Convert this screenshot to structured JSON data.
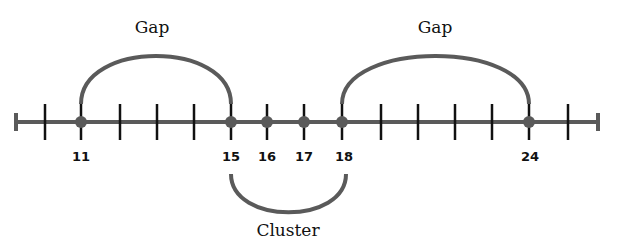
{
  "diagram": {
    "title": "",
    "axis": {
      "y": 122,
      "x_start": 16,
      "x_end": 598,
      "color": "#5a5a5a"
    },
    "ticks_x": [
      45,
      81,
      120,
      157,
      194,
      231,
      267,
      304,
      342,
      381,
      418,
      455,
      492,
      529,
      568
    ],
    "points": [
      {
        "value": "11",
        "x": 81
      },
      {
        "value": "15",
        "x": 231
      },
      {
        "value": "16",
        "x": 267
      },
      {
        "value": "17",
        "x": 304
      },
      {
        "value": "18",
        "x": 342
      },
      {
        "value": "24",
        "x": 529
      }
    ],
    "annotations": [
      {
        "label": "Gap",
        "from": "11",
        "to": "15",
        "position": "above"
      },
      {
        "label": "Gap",
        "from": "18",
        "to": "24",
        "position": "above"
      },
      {
        "label": "Cluster",
        "from": "15",
        "to": "18",
        "position": "below"
      }
    ]
  }
}
